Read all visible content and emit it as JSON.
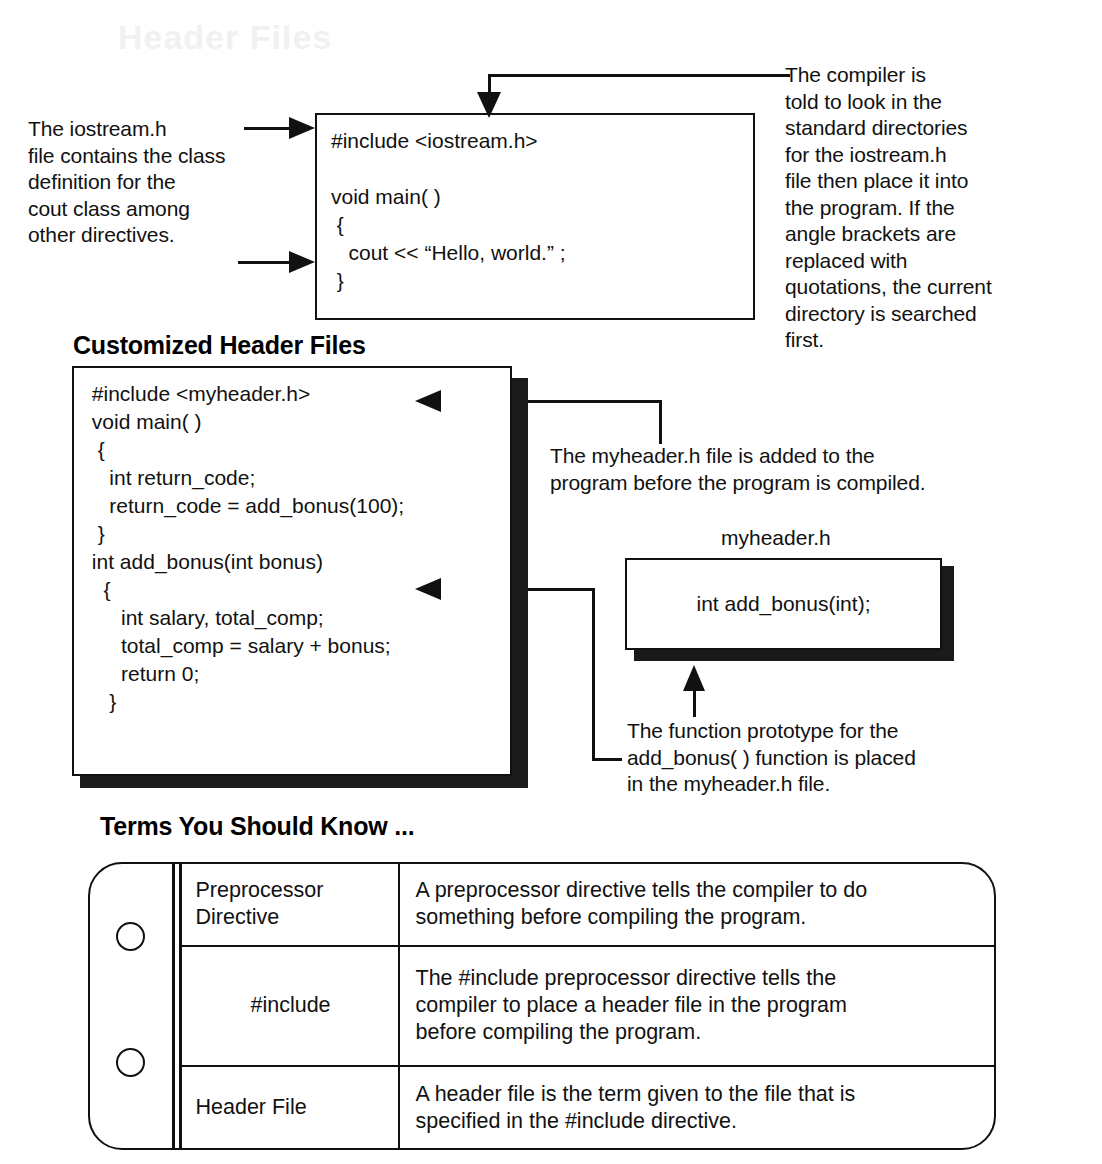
{
  "page": {
    "ghost_text": "Header Files"
  },
  "headings": {
    "customized_header_files": "Customized Header Files",
    "terms_you_should_know": "Terms You Should Know ..."
  },
  "code_boxes": {
    "hello_world": {
      "lines": [
        "#include <iostream.h>",
        "",
        "void main( )",
        " {",
        "   cout << “Hello, world.” ;",
        " }"
      ]
    },
    "myheader_program": {
      "lines": [
        " #include <myheader.h>",
        " void main( )",
        "  {",
        "    int return_code;",
        "    return_code = add_bonus(100);",
        "  }",
        " int add_bonus(int bonus)",
        "   {",
        "      int salary, total_comp;",
        "      total_comp = salary + bonus;",
        "      return 0;",
        "    }"
      ]
    },
    "myheader_file": {
      "caption": "myheader.h",
      "lines": [
        "int add_bonus(int);"
      ]
    }
  },
  "annotations": {
    "iostream_left": "The iostream.h\nfile contains the class\ndefinition for the\ncout class among\nother directives.",
    "compiler_right": "The compiler is\ntold to look in the\nstandard directories\nfor the iostream.h\nfile then place it into\nthe program. If the\nangle brackets are\nreplaced with\nquotations, the current\ndirectory is searched\nfirst.",
    "myheader_added": "The myheader.h file is added to the\nprogram before the program is compiled.",
    "function_prototype": "The function prototype for the\nadd_bonus( ) function is placed\nin the myheader.h file."
  },
  "terms_table": {
    "rows": [
      {
        "term": "Preprocessor\nDirective",
        "term_align": "left",
        "definition": "A preprocessor directive tells the compiler to do\nsomething before compiling the program."
      },
      {
        "term": "#include",
        "term_align": "center",
        "definition": "The #include preprocessor directive tells the\ncompiler to place a header file in the program\nbefore compiling the program."
      },
      {
        "term": "Header File",
        "term_align": "left",
        "definition": "A header file is the term given to the file that is\nspecified in the #include directive."
      }
    ]
  },
  "colors": {
    "ink": "#111111",
    "paper": "#ffffff",
    "shadow": "#1a1a1a"
  }
}
